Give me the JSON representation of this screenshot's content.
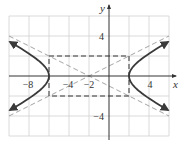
{
  "figure": {
    "type": "hyperbola-graph",
    "equation": "(x+2)^2/16 - y^2/4 = 1",
    "center": [
      -2,
      0
    ],
    "a": 4,
    "b": 2,
    "vertices": [
      [
        -6,
        0
      ],
      [
        2,
        0
      ]
    ],
    "asymptotes": [
      "y = (x+2)/2",
      "y = -(x+2)/2"
    ],
    "fundamental_rectangle": {
      "x_min": -6,
      "x_max": 2,
      "y_min": -2,
      "y_max": 2
    },
    "x_range": [
      -10,
      6
    ],
    "y_range": [
      -6,
      6
    ],
    "grid_step": 2
  },
  "axes": {
    "x_label": "x",
    "y_label": "y",
    "x_ticks": [
      {
        "value": -8,
        "label": "−8"
      },
      {
        "value": -4,
        "label": "−4"
      },
      {
        "value": -2,
        "label": "−2"
      },
      {
        "value": 4,
        "label": "4"
      }
    ],
    "y_ticks": [
      {
        "value": 4,
        "label": "4"
      },
      {
        "value": -4,
        "label": "−4"
      }
    ]
  },
  "colors": {
    "curve": "#3a3a3a",
    "asymptote": "#9a9a9a",
    "rectangle": "#333333",
    "grid": "#d0d0d0",
    "axis": "#333333"
  }
}
